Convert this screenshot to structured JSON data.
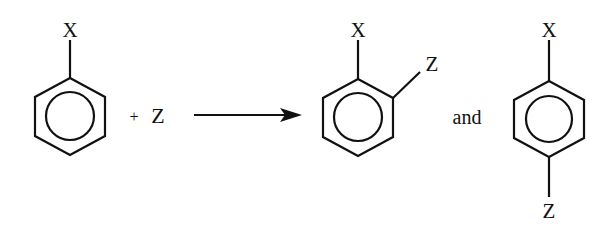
{
  "diagram": {
    "type": "chemical-reaction",
    "reactant": {
      "substituent_label": "X",
      "ring": "benzene"
    },
    "plus_sign": "+",
    "reagent_label": "Z",
    "arrow": "reaction-arrow",
    "products": [
      {
        "name": "ortho-product",
        "substituents": [
          "X",
          "Z"
        ]
      },
      {
        "name": "para-product",
        "substituents": [
          "X",
          "Z"
        ]
      }
    ],
    "conjunction": "and",
    "colors": {
      "line": "#111111",
      "background": "#ffffff"
    }
  }
}
